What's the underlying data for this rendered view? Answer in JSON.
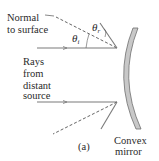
{
  "figure": {
    "panel_label": "(a)",
    "labels": {
      "normal_line1": "Normal",
      "normal_line2": "to surface",
      "rays_line1": "Rays",
      "rays_line2": "from",
      "rays_line3": "distant",
      "rays_line4": "source",
      "mirror_line1": "Convex",
      "mirror_line2": "mirror",
      "theta_i": "θ",
      "theta_i_sub": "i",
      "theta_r": "θ",
      "theta_r_sub": "r"
    },
    "colors": {
      "ray": "#7a7a7a",
      "mirror_fill": "#c8c8c8",
      "mirror_stroke": "#6e6e6e",
      "text": "#2a2a2a",
      "background": "#ffffff"
    }
  }
}
